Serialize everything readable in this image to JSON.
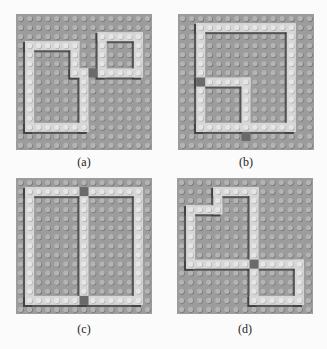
{
  "figure": {
    "colors": {
      "baseplate": "#9c9c9c",
      "stud": "#b4b4b4",
      "stud_shadow": "#6e6e6e",
      "brick": "#d6d6d6",
      "brick_stud": "#e6e6e6",
      "shadow": "#3c3c3c",
      "connector": "#6a6a6a"
    },
    "grid": 15,
    "panels": [
      {
        "id": "a",
        "caption": "(a)",
        "x": 16,
        "y": 14,
        "bricks": [
          [
            1,
            3,
            1,
            10
          ],
          [
            1,
            3,
            6,
            1
          ],
          [
            6,
            3,
            1,
            4
          ],
          [
            6,
            6,
            2,
            1
          ],
          [
            7,
            6,
            1,
            7
          ],
          [
            1,
            12,
            7,
            1
          ],
          [
            9,
            2,
            5,
            1
          ],
          [
            9,
            2,
            1,
            5
          ],
          [
            13,
            2,
            1,
            5
          ],
          [
            9,
            6,
            5,
            1
          ]
        ],
        "connectors": [
          [
            8,
            6,
            1,
            1
          ]
        ]
      },
      {
        "id": "b",
        "caption": "(b)",
        "x": 178,
        "y": 14,
        "bricks": [
          [
            2,
            1,
            11,
            1
          ],
          [
            2,
            1,
            1,
            12
          ],
          [
            12,
            1,
            1,
            12
          ],
          [
            2,
            12,
            11,
            1
          ],
          [
            2,
            7,
            6,
            1
          ],
          [
            7,
            7,
            1,
            6
          ]
        ],
        "connectors": [
          [
            2,
            7,
            1,
            1
          ],
          [
            7,
            13,
            1,
            1
          ]
        ]
      },
      {
        "id": "c",
        "caption": "(c)",
        "x": 16,
        "y": 178,
        "bricks": [
          [
            1,
            1,
            13,
            1
          ],
          [
            1,
            1,
            1,
            13
          ],
          [
            13,
            1,
            1,
            13
          ],
          [
            1,
            13,
            13,
            1
          ],
          [
            7,
            1,
            1,
            13
          ]
        ],
        "connectors": [
          [
            7,
            1,
            1,
            1
          ],
          [
            7,
            13,
            1,
            1
          ]
        ]
      },
      {
        "id": "d",
        "caption": "(d)",
        "x": 177,
        "y": 178,
        "bricks": [
          [
            4,
            1,
            5,
            1
          ],
          [
            4,
            1,
            1,
            3
          ],
          [
            1,
            3,
            4,
            1
          ],
          [
            1,
            3,
            1,
            7
          ],
          [
            1,
            9,
            8,
            1
          ],
          [
            8,
            1,
            1,
            9
          ],
          [
            8,
            9,
            6,
            1
          ],
          [
            13,
            9,
            1,
            5
          ],
          [
            8,
            13,
            6,
            1
          ],
          [
            8,
            9,
            1,
            5
          ]
        ],
        "connectors": [
          [
            8,
            9,
            1,
            1
          ]
        ]
      }
    ]
  }
}
